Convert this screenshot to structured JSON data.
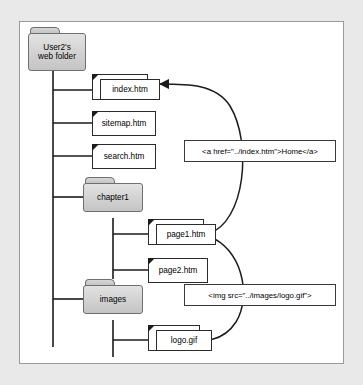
{
  "figure": {
    "background_color": "#e9e9e9",
    "panel_color": "#ffffff",
    "border_color": "#9a9a9a"
  },
  "tree": {
    "root": {
      "name": "root-folder",
      "type": "folder",
      "label_line1": "User2's",
      "label_line2": "web folder"
    },
    "children": [
      {
        "name": "index-htm",
        "type": "file",
        "label": "index.htm",
        "stacked": true
      },
      {
        "name": "sitemap-htm",
        "type": "file",
        "label": "sitemap.htm",
        "stacked": false
      },
      {
        "name": "search-htm",
        "type": "file",
        "label": "search.htm",
        "stacked": false
      },
      {
        "name": "chapter1-folder",
        "type": "folder",
        "label": "chapter1"
      },
      {
        "name": "images-folder",
        "type": "folder",
        "label": "images"
      }
    ],
    "chapter1_children": [
      {
        "name": "page1-htm",
        "type": "file",
        "label": "page1.htm",
        "stacked": true
      },
      {
        "name": "page2-htm",
        "type": "file",
        "label": "page2.htm",
        "stacked": false
      }
    ],
    "images_children": [
      {
        "name": "logo-gif",
        "type": "file",
        "label": "logo.gif",
        "stacked": true
      }
    ]
  },
  "callouts": [
    {
      "name": "anchor-tag-callout",
      "code": "<a href=\"../index.htm\">Home</a>",
      "points_to": "index.htm",
      "origin": "page1.htm"
    },
    {
      "name": "img-tag-callout",
      "code": "<img src=\"../images/logo.gif\">",
      "points_to": "logo.gif",
      "origin": "page1.htm"
    }
  ]
}
